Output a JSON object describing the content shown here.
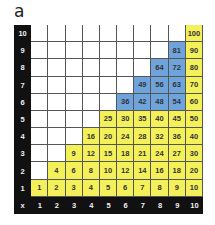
{
  "panel_label": "a",
  "colors": {
    "yellow": "#f4f05a",
    "blue": "#6ea3dc",
    "axis": "#111111",
    "empty": "#ffffff"
  },
  "axis": {
    "corner": "x",
    "rows": [
      "10",
      "9",
      "8",
      "7",
      "6",
      "5",
      "4",
      "3",
      "2",
      "1"
    ],
    "cols": [
      "1",
      "2",
      "3",
      "4",
      "5",
      "6",
      "7",
      "8",
      "9",
      "10"
    ]
  },
  "rows": [
    {
      "y": "10",
      "cells": [
        [
          "",
          ""
        ],
        [
          "",
          ""
        ],
        [
          "",
          ""
        ],
        [
          "",
          ""
        ],
        [
          "",
          ""
        ],
        [
          "",
          ""
        ],
        [
          "",
          ""
        ],
        [
          "",
          ""
        ],
        [
          "",
          ""
        ],
        [
          "100",
          "yellow"
        ]
      ]
    },
    {
      "y": "9",
      "cells": [
        [
          "",
          ""
        ],
        [
          "",
          ""
        ],
        [
          "",
          ""
        ],
        [
          "",
          ""
        ],
        [
          "",
          ""
        ],
        [
          "",
          ""
        ],
        [
          "",
          ""
        ],
        [
          "",
          ""
        ],
        [
          "81",
          "blue"
        ],
        [
          "90",
          "yellow"
        ]
      ]
    },
    {
      "y": "8",
      "cells": [
        [
          "",
          ""
        ],
        [
          "",
          ""
        ],
        [
          "",
          ""
        ],
        [
          "",
          ""
        ],
        [
          "",
          ""
        ],
        [
          "",
          ""
        ],
        [
          "",
          ""
        ],
        [
          "64",
          "blue"
        ],
        [
          "72",
          "blue"
        ],
        [
          "80",
          "yellow"
        ]
      ]
    },
    {
      "y": "7",
      "cells": [
        [
          "",
          ""
        ],
        [
          "",
          ""
        ],
        [
          "",
          ""
        ],
        [
          "",
          ""
        ],
        [
          "",
          ""
        ],
        [
          "",
          ""
        ],
        [
          "49",
          "blue"
        ],
        [
          "56",
          "blue"
        ],
        [
          "63",
          "blue"
        ],
        [
          "70",
          "yellow"
        ]
      ]
    },
    {
      "y": "6",
      "cells": [
        [
          "",
          ""
        ],
        [
          "",
          ""
        ],
        [
          "",
          ""
        ],
        [
          "",
          ""
        ],
        [
          "",
          ""
        ],
        [
          "36",
          "blue"
        ],
        [
          "42",
          "blue"
        ],
        [
          "48",
          "blue"
        ],
        [
          "54",
          "blue"
        ],
        [
          "60",
          "yellow"
        ]
      ]
    },
    {
      "y": "5",
      "cells": [
        [
          "",
          ""
        ],
        [
          "",
          ""
        ],
        [
          "",
          ""
        ],
        [
          "",
          ""
        ],
        [
          "25",
          "yellow"
        ],
        [
          "30",
          "yellow"
        ],
        [
          "35",
          "yellow"
        ],
        [
          "40",
          "yellow"
        ],
        [
          "45",
          "yellow"
        ],
        [
          "50",
          "yellow"
        ]
      ]
    },
    {
      "y": "4",
      "cells": [
        [
          "",
          ""
        ],
        [
          "",
          ""
        ],
        [
          "",
          ""
        ],
        [
          "16",
          "yellow"
        ],
        [
          "20",
          "yellow"
        ],
        [
          "24",
          "yellow"
        ],
        [
          "28",
          "yellow"
        ],
        [
          "32",
          "yellow"
        ],
        [
          "36",
          "yellow"
        ],
        [
          "40",
          "yellow"
        ]
      ]
    },
    {
      "y": "3",
      "cells": [
        [
          "",
          ""
        ],
        [
          "",
          ""
        ],
        [
          "9",
          "yellow"
        ],
        [
          "12",
          "yellow"
        ],
        [
          "15",
          "yellow"
        ],
        [
          "18",
          "yellow"
        ],
        [
          "21",
          "yellow"
        ],
        [
          "24",
          "yellow"
        ],
        [
          "27",
          "yellow"
        ],
        [
          "30",
          "yellow"
        ]
      ]
    },
    {
      "y": "2",
      "cells": [
        [
          "",
          ""
        ],
        [
          "4",
          "yellow"
        ],
        [
          "6",
          "yellow"
        ],
        [
          "8",
          "yellow"
        ],
        [
          "10",
          "yellow"
        ],
        [
          "12",
          "yellow"
        ],
        [
          "14",
          "yellow"
        ],
        [
          "16",
          "yellow"
        ],
        [
          "18",
          "yellow"
        ],
        [
          "20",
          "yellow"
        ]
      ]
    },
    {
      "y": "1",
      "cells": [
        [
          "1",
          "yellow"
        ],
        [
          "2",
          "yellow"
        ],
        [
          "3",
          "yellow"
        ],
        [
          "4",
          "yellow"
        ],
        [
          "5",
          "yellow"
        ],
        [
          "6",
          "yellow"
        ],
        [
          "7",
          "yellow"
        ],
        [
          "8",
          "yellow"
        ],
        [
          "9",
          "yellow"
        ],
        [
          "10",
          "yellow"
        ]
      ]
    }
  ]
}
